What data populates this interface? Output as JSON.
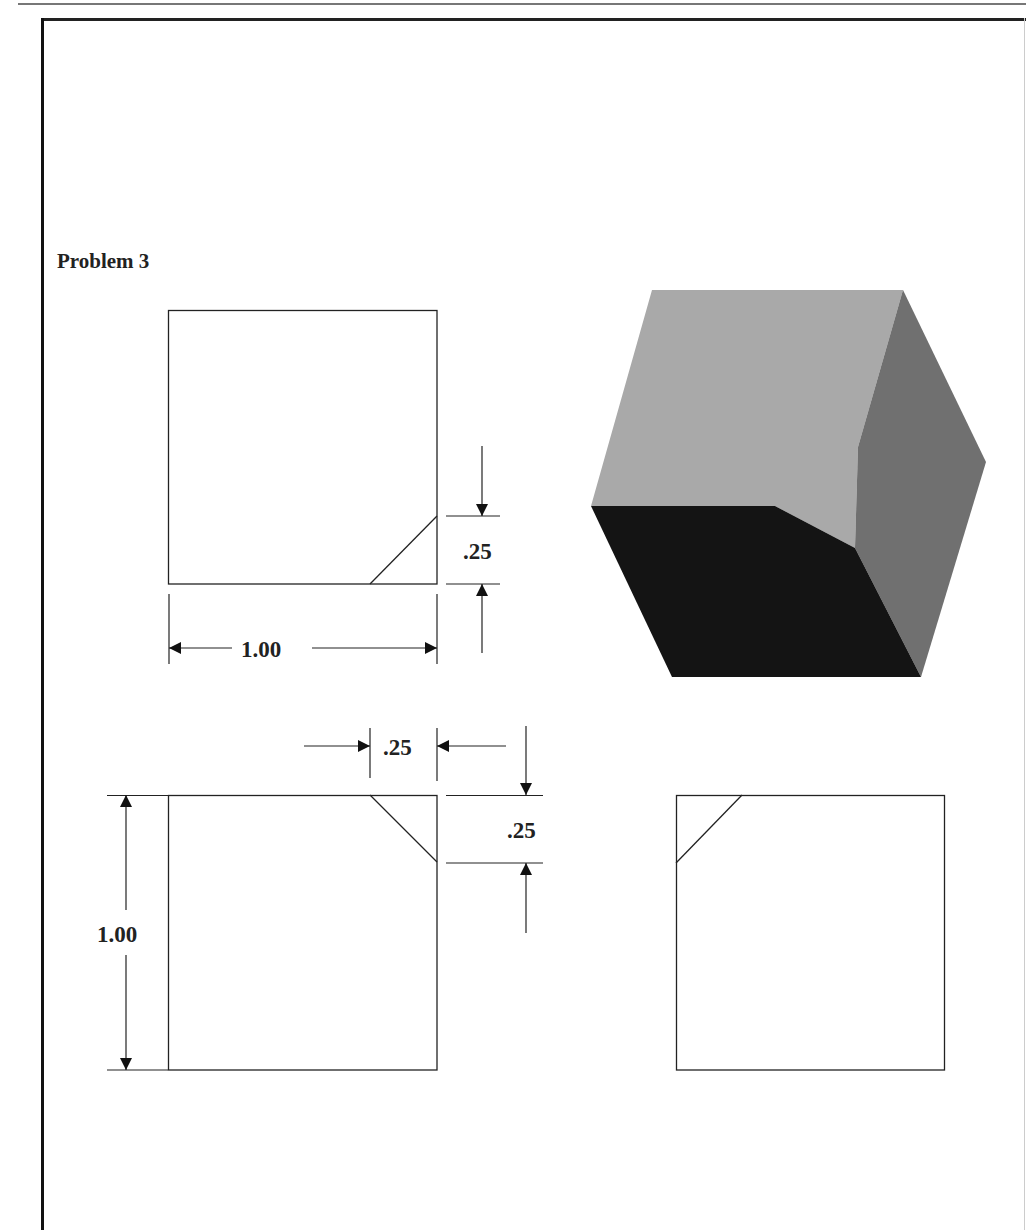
{
  "page": {
    "title": "Problem 3"
  },
  "views": {
    "top_view": {
      "label": "top view",
      "dimensions": {
        "width": "1.00",
        "chamfer_height": ".25"
      }
    },
    "front_view": {
      "label": "front view",
      "dimensions": {
        "height": "1.00",
        "chamfer_width": ".25",
        "chamfer_height": ".25"
      }
    },
    "right_side_view": {
      "label": "right side view"
    },
    "isometric_view": {
      "label": "isometric cube with chamfered corner",
      "colors": {
        "top_face": "#a9a9a9",
        "front_face": "#141414",
        "right_face": "#707070"
      }
    }
  },
  "colors": {
    "line": "#222222",
    "frame": "#111111",
    "background": "#ffffff"
  }
}
